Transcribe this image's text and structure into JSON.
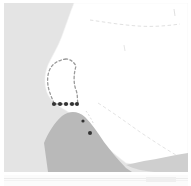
{
  "map": {
    "title": "Coastal region map thumbnail",
    "type": "reference-map",
    "panel_label": "map-panel",
    "secondary_panel_label": "secondary-map-panel",
    "colors": {
      "ocean": "#e4e4e4",
      "land": "#ffffff",
      "shaded_territory": "#b9b9b9",
      "shaded_territory_light": "#cfcfcf",
      "border_dash": "#dcdcdc",
      "selection_dash": "#9a9a9a",
      "marker_dot": "#333333",
      "background": "#ffffff"
    },
    "features": {
      "ocean_label": "ocean-region",
      "land_label": "landmass-region",
      "shaded_label": "shaded-territory-region",
      "coastline_label": "coastline",
      "selection_label": "selection-outline",
      "markers_label": "marker-dots",
      "internal_border_label": "internal-border-dashed",
      "diagonal_border_label": "diagonal-border-dashed"
    },
    "marker_dots": [
      {
        "cx": 50,
        "cy": 101,
        "r": 2.1
      },
      {
        "cx": 56,
        "cy": 101,
        "r": 2.1
      },
      {
        "cx": 62,
        "cy": 101,
        "r": 2.1
      },
      {
        "cx": 68,
        "cy": 101,
        "r": 2.1
      },
      {
        "cx": 73,
        "cy": 101,
        "r": 2.0
      },
      {
        "cx": 86,
        "cy": 130,
        "r": 2.0
      },
      {
        "cx": 79,
        "cy": 118,
        "r": 1.6
      }
    ],
    "geometry": {
      "coastline_path": "M 184,0 L 70,0 C 66,10 62,22 58,33 C 54,44 48,53 44,62 C 41,70 40,78 42,86 C 44,95 50,100 56,104 C 63,108 70,112 76,118 C 83,125 90,133 98,140 C 106,147 114,154 122,160 L 184,169 Z",
      "shaded_path": "M 44,169 L 40,140 C 44,130 50,120 58,113 C 66,107 74,108 81,114 C 88,121 94,130 100,139 C 107,148 114,157 122,165 L 128,169 Z",
      "shaded_light_path": "M 122,162 C 130,166 140,168 150,169 L 184,169 L 184,150 C 170,152 154,156 140,158 Z",
      "selection_path": "M 62,56 C 55,57 49,60 46,66 C 43,72 43,80 45,87 C 47,94 50,99 50,101 L 74,101 C 73,97 74,92 72,87 C 69,79 70,70 72,63 C 70,59 66,56 62,56 Z",
      "border_top_path": "M 86,17 C 100,19 118,22 134,23 C 148,24 162,23 176,21",
      "border_diag_path": "M 94,100 C 108,109 122,119 136,129 C 148,137 160,145 172,152",
      "border_tick1_path": "M 170,6 L 171,13",
      "border_tick2_path": "M 120,42 L 121,48",
      "inland_mark_path": "M 82,108 C 85,112 88,117 90,122"
    }
  }
}
